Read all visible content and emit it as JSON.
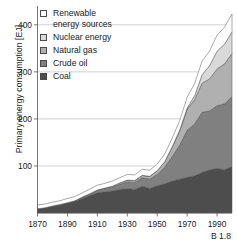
{
  "caption": "B 1.8",
  "legend": {
    "items": [
      {
        "label": "Renewable\nenergy sources",
        "color": "#ffffff",
        "key": "renewable"
      },
      {
        "label": "Nuclear energy",
        "color": "#d9d9d9",
        "key": "nuclear"
      },
      {
        "label": "Natural gas",
        "color": "#b0b0b0",
        "key": "gas"
      },
      {
        "label": "Crude oil",
        "color": "#808080",
        "key": "oil"
      },
      {
        "label": "Coal",
        "color": "#4d4d4d",
        "key": "coal"
      }
    ]
  },
  "chart_data": {
    "type": "area",
    "stacked": true,
    "title": "",
    "xlabel": "",
    "ylabel": "Primary energy consumption [EJ]",
    "xlim": [
      1870,
      2000
    ],
    "ylim": [
      0,
      440
    ],
    "yticks": [
      100,
      200,
      300,
      400
    ],
    "xticks": [
      1870,
      1890,
      1910,
      1930,
      1950,
      1970,
      1990
    ],
    "grid": "horizontal",
    "legend_position": "upper-left",
    "x": [
      1870,
      1875,
      1880,
      1885,
      1890,
      1895,
      1900,
      1905,
      1910,
      1915,
      1920,
      1925,
      1930,
      1935,
      1940,
      1945,
      1950,
      1955,
      1960,
      1965,
      1970,
      1975,
      1980,
      1985,
      1990,
      1995,
      2000
    ],
    "series": [
      {
        "name": "Coal",
        "color": "#4d4d4d",
        "values": [
          9,
          11,
          14,
          17,
          21,
          25,
          31,
          37,
          43,
          45,
          47,
          50,
          52,
          50,
          57,
          52,
          58,
          62,
          68,
          72,
          76,
          79,
          86,
          92,
          95,
          92,
          99
        ]
      },
      {
        "name": "Crude oil",
        "color": "#808080",
        "values": [
          0,
          0,
          1,
          1,
          1,
          1,
          2,
          3,
          5,
          6,
          8,
          11,
          14,
          15,
          18,
          20,
          24,
          35,
          52,
          72,
          100,
          110,
          128,
          125,
          133,
          140,
          148
        ]
      },
      {
        "name": "Natural gas",
        "color": "#b0b0b0",
        "values": [
          0,
          0,
          0,
          0,
          0,
          0,
          1,
          1,
          1,
          2,
          2,
          3,
          4,
          4,
          5,
          6,
          8,
          12,
          20,
          30,
          44,
          52,
          62,
          68,
          78,
          85,
          92
        ]
      },
      {
        "name": "Nuclear energy",
        "color": "#d9d9d9",
        "values": [
          0,
          0,
          0,
          0,
          0,
          0,
          0,
          0,
          0,
          0,
          0,
          0,
          0,
          0,
          0,
          0,
          0,
          0,
          1,
          2,
          3,
          8,
          18,
          28,
          38,
          42,
          46
        ]
      },
      {
        "name": "Renewable energy sources",
        "color": "#ffffff",
        "values": [
          8,
          8,
          8,
          8,
          9,
          9,
          9,
          10,
          10,
          10,
          11,
          11,
          12,
          12,
          13,
          13,
          14,
          16,
          18,
          20,
          23,
          26,
          29,
          31,
          34,
          36,
          38
        ]
      }
    ]
  }
}
